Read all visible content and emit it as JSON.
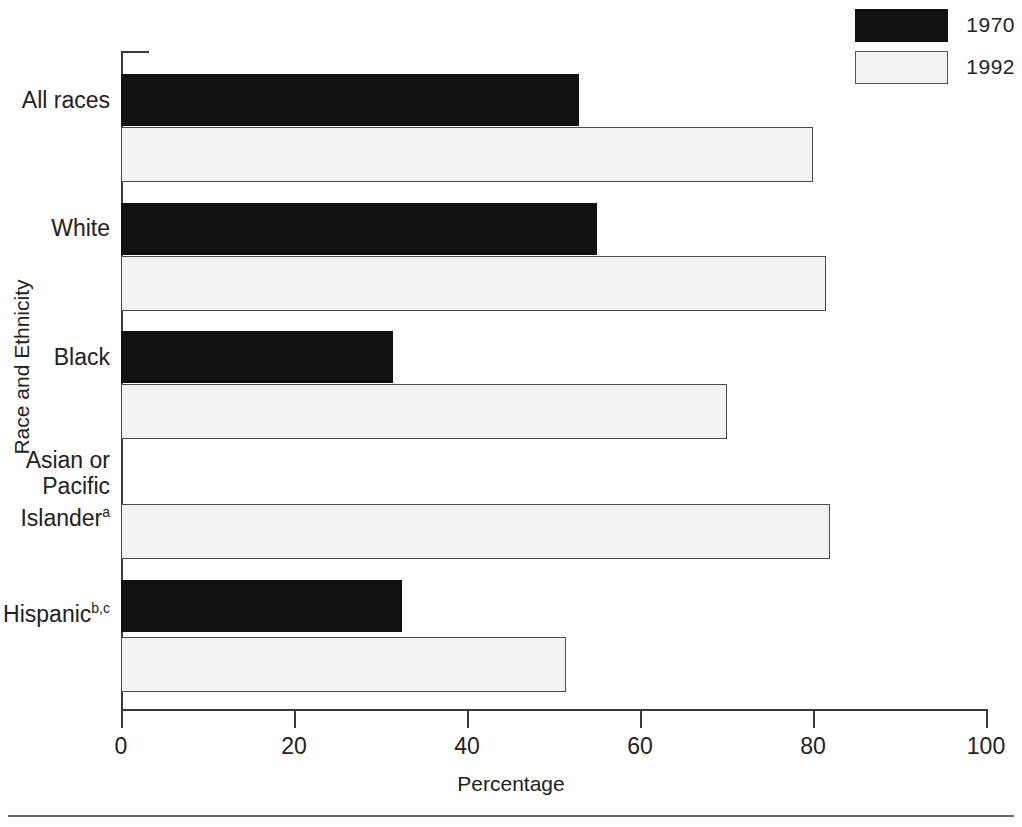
{
  "chart_data": {
    "type": "bar",
    "orientation": "horizontal",
    "title": "",
    "xlabel": "Percentage",
    "ylabel": "Race and Ethnicity",
    "xlim": [
      0,
      100
    ],
    "xticks": [
      "0",
      "20",
      "40",
      "60",
      "80",
      "100"
    ],
    "xtick_values": [
      0,
      20,
      40,
      60,
      80,
      100
    ],
    "grid": false,
    "legend_position": "top-right",
    "categories": [
      "All races",
      "White",
      "Black",
      "Asian or Pacific Islander",
      "Hispanic"
    ],
    "category_footnotes": [
      "",
      "",
      "",
      "a",
      "b,c"
    ],
    "series": [
      {
        "name": "1970",
        "color": "#111111",
        "values": [
          53,
          55,
          31.5,
          null,
          32.5
        ]
      },
      {
        "name": "1992",
        "color": "#f2f2f2",
        "values": [
          80,
          81.5,
          70,
          82,
          51.5
        ]
      }
    ]
  },
  "legend": {
    "items": [
      {
        "label": "1970",
        "swatch": "dark"
      },
      {
        "label": "1992",
        "swatch": "light"
      }
    ]
  },
  "axes": {
    "x": {
      "label": "Percentage",
      "ticks": [
        "0",
        "20",
        "40",
        "60",
        "80",
        "100"
      ]
    },
    "y": {
      "label": "Race and Ethnicity",
      "categories": [
        {
          "lines": [
            "All races"
          ],
          "footnote": ""
        },
        {
          "lines": [
            "White"
          ],
          "footnote": ""
        },
        {
          "lines": [
            "Black"
          ],
          "footnote": ""
        },
        {
          "lines": [
            "Asian or",
            "Pacific",
            "Islander"
          ],
          "footnote": "a"
        },
        {
          "lines": [
            "Hispanic"
          ],
          "footnote": "b,c"
        }
      ]
    }
  }
}
